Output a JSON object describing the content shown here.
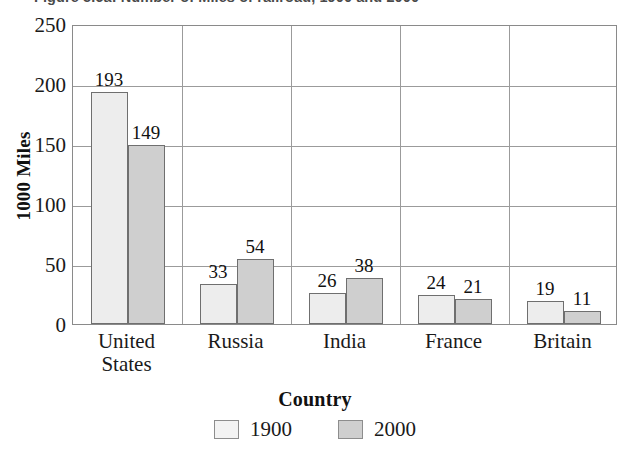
{
  "figure": {
    "title": "Figure 5.6a: Number of Miles of railroad, 1900 and 2000"
  },
  "chart_data": {
    "type": "bar",
    "title": "Figure 5.6a: Number of Miles of railroad, 1900 and 2000",
    "xlabel": "Country",
    "ylabel": "1000 Miles",
    "categories": [
      "United States",
      "Russia",
      "India",
      "France",
      "Britain"
    ],
    "category_lines": [
      [
        "United",
        "States"
      ],
      [
        "Russia"
      ],
      [
        "India"
      ],
      [
        "France"
      ],
      [
        "Britain"
      ]
    ],
    "series": [
      {
        "name": "1900",
        "values": [
          193,
          33,
          26,
          24,
          19
        ],
        "color": "#ededed"
      },
      {
        "name": "2000",
        "values": [
          149,
          54,
          38,
          21,
          11
        ],
        "color": "#cfcfcf"
      }
    ],
    "ylim": [
      0,
      250
    ],
    "yticks": [
      0,
      50,
      100,
      150,
      200,
      250
    ],
    "ytick_labels": [
      "0",
      "50",
      "100",
      "150",
      "200",
      "250"
    ],
    "grid": "horizontal-and-category-separators",
    "legend_position": "bottom-center",
    "bar_value_labels": [
      [
        "193",
        "149"
      ],
      [
        "33",
        "54"
      ],
      [
        "26",
        "38"
      ],
      [
        "24",
        "21"
      ],
      [
        "19",
        "11"
      ]
    ]
  }
}
